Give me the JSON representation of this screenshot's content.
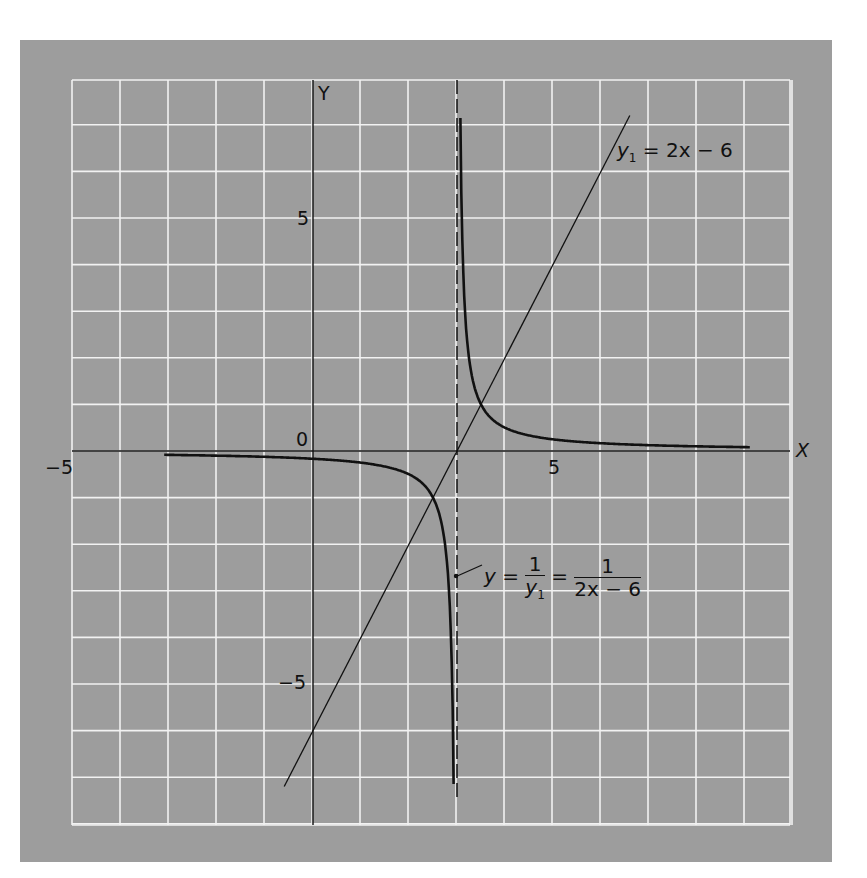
{
  "chart_data": {
    "type": "line",
    "title": "",
    "xlabel": "X",
    "ylabel": "Y",
    "origin_label": "0",
    "xlim": [
      -5,
      10
    ],
    "ylim": [
      -8,
      8
    ],
    "grid": true,
    "grid_step": 1,
    "x_ticks": [
      {
        "value": -5,
        "label": "-5"
      },
      {
        "value": 5,
        "label": "5"
      }
    ],
    "y_ticks": [
      {
        "value": 5,
        "label": "5"
      },
      {
        "value": -5,
        "label": "-5"
      }
    ],
    "asymptote": {
      "type": "vertical",
      "x": 3,
      "style": "dashed"
    },
    "series": [
      {
        "name": "y1 = 2x - 6",
        "kind": "line",
        "x": [
          -0.6,
          6.6
        ],
        "y": [
          -7.2,
          7.2
        ]
      },
      {
        "name": "y = 1/y1 = 1/(2x-6)",
        "kind": "hyperbola",
        "branches": [
          {
            "x": [
              -3.1,
              -2,
              -1,
              0,
              1,
              2,
              2.5,
              2.8,
              2.9,
              2.93
            ],
            "y": [
              -0.082,
              -0.1,
              -0.125,
              -0.167,
              -0.25,
              -0.5,
              -1,
              -2.5,
              -5,
              -7.1
            ]
          },
          {
            "x": [
              3.07,
              3.1,
              3.2,
              3.5,
              4,
              5,
              6,
              7,
              8,
              9.1
            ],
            "y": [
              7.1,
              5,
              2.5,
              1,
              0.5,
              0.25,
              0.167,
              0.125,
              0.1,
              0.082
            ]
          }
        ]
      }
    ],
    "annotations": [
      {
        "text": "y1 = 2x − 6",
        "position": "upper right, along line"
      },
      {
        "text": "y = 1/y1 = 1/(2x − 6)",
        "position": "lower, arrow pointing to left branch near asymptote"
      }
    ]
  },
  "labels": {
    "x_axis": "X",
    "y_axis": "Y",
    "origin": "0",
    "x_neg5": "−5",
    "x_pos5": "5",
    "y_pos5": "5",
    "y_neg5": "−5"
  },
  "eq1": {
    "lhs": "y",
    "sub": "1",
    "rhs": "= 2x − 6"
  },
  "eq2": {
    "lhs": "y =",
    "f1_num": "1",
    "f1_den": "y",
    "f1_den_sub": "1",
    "eq": "=",
    "f2_num": "1",
    "f2_den": "2x − 6"
  },
  "colors": {
    "panel": "#9d9d9d",
    "grid": "#f4f4f4",
    "ink": "#111111"
  }
}
